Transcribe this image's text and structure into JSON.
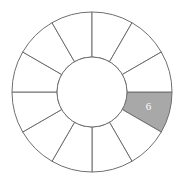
{
  "figure": {
    "name": "segmented-ring-diagram",
    "background_color": "#ffffff",
    "width": 184,
    "height": 187
  },
  "chart_data": {
    "type": "pie",
    "variant": "donut-ring-equal-segments",
    "title": "",
    "subtitle": "",
    "xlabel": "",
    "ylabel": "",
    "legend": null,
    "grid": false,
    "center": {
      "x": 92,
      "y": 92
    },
    "outer_radius": 80,
    "inner_radius": 35,
    "segment_count": 12,
    "segment_angle_degrees": 30,
    "start_angle_degrees": 0,
    "stroke_color": "#6e6e6e",
    "stroke_width": 1,
    "default_fill": "#ffffff",
    "highlight_fill": "#a8a8a8",
    "label_color": "#ffffff",
    "categories": [
      "seg-1",
      "seg-2",
      "seg-3",
      "seg-4",
      "seg-5",
      "seg-6",
      "seg-7",
      "seg-8",
      "seg-9",
      "seg-10",
      "seg-11",
      "seg-12"
    ],
    "values": [
      30,
      30,
      30,
      30,
      30,
      30,
      30,
      30,
      30,
      30,
      30,
      30
    ],
    "segments": [
      {
        "index": 0,
        "start_deg": 0,
        "end_deg": 30,
        "fill": "#a8a8a8",
        "label": "6",
        "shaded": true
      },
      {
        "index": 1,
        "start_deg": 30,
        "end_deg": 60,
        "fill": "#ffffff",
        "label": "",
        "shaded": false
      },
      {
        "index": 2,
        "start_deg": 60,
        "end_deg": 90,
        "fill": "#ffffff",
        "label": "",
        "shaded": false
      },
      {
        "index": 3,
        "start_deg": 90,
        "end_deg": 120,
        "fill": "#ffffff",
        "label": "",
        "shaded": false
      },
      {
        "index": 4,
        "start_deg": 120,
        "end_deg": 150,
        "fill": "#ffffff",
        "label": "",
        "shaded": false
      },
      {
        "index": 5,
        "start_deg": 150,
        "end_deg": 180,
        "fill": "#ffffff",
        "label": "",
        "shaded": false
      },
      {
        "index": 6,
        "start_deg": 180,
        "end_deg": 210,
        "fill": "#ffffff",
        "label": "",
        "shaded": false
      },
      {
        "index": 7,
        "start_deg": 210,
        "end_deg": 240,
        "fill": "#ffffff",
        "label": "",
        "shaded": false
      },
      {
        "index": 8,
        "start_deg": 240,
        "end_deg": 270,
        "fill": "#ffffff",
        "label": "",
        "shaded": false
      },
      {
        "index": 9,
        "start_deg": 270,
        "end_deg": 300,
        "fill": "#ffffff",
        "label": "",
        "shaded": false
      },
      {
        "index": 10,
        "start_deg": 300,
        "end_deg": 330,
        "fill": "#ffffff",
        "label": "",
        "shaded": false
      },
      {
        "index": 11,
        "start_deg": 330,
        "end_deg": 360,
        "fill": "#ffffff",
        "label": "",
        "shaded": false
      }
    ],
    "annotations": [
      {
        "text": "6",
        "segment_index": 0,
        "color": "#ffffff"
      }
    ]
  }
}
